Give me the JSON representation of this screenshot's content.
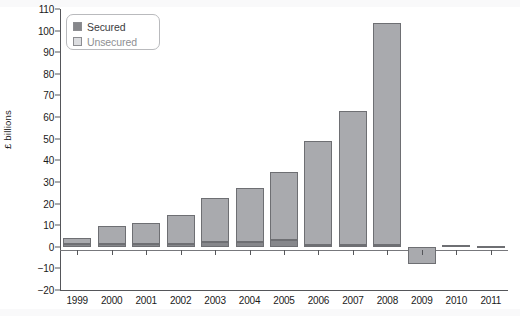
{
  "chart_data": {
    "type": "bar",
    "subtype": "stacked-bar",
    "title": "",
    "xlabel": "",
    "ylabel": "£ billions",
    "ylim": [
      -20,
      110
    ],
    "ytick_step": 10,
    "yticks": [
      110,
      100,
      90,
      80,
      70,
      60,
      50,
      40,
      30,
      20,
      10,
      0,
      -10,
      -20
    ],
    "ytick_labels": [
      "110",
      "100",
      "90",
      "80",
      "70",
      "60",
      "50",
      "40",
      "30",
      "20",
      "10",
      "0",
      "-10",
      "-20"
    ],
    "grid": false,
    "legend_position": "upper-left-inside",
    "categories": [
      "1999",
      "2000",
      "2001",
      "2002",
      "2003",
      "2004",
      "2005",
      "2006",
      "2007",
      "2008",
      "2009",
      "2010",
      "2011"
    ],
    "series": [
      {
        "name": "Secured",
        "color": "#86878b",
        "values": [
          1.5,
          1.5,
          1.5,
          1.5,
          2.0,
          2.0,
          3.0,
          1.0,
          1.0,
          1.0,
          0.0,
          0.0,
          0.0
        ]
      },
      {
        "name": "Unsecured",
        "color": "#a9aaae",
        "values": [
          2.5,
          8.0,
          9.5,
          13.0,
          20.5,
          25.0,
          31.5,
          48.0,
          62.0,
          102.5,
          -8.0,
          0.7,
          0.5
        ]
      }
    ],
    "totals": [
      4.0,
      9.5,
      11.0,
      14.5,
      22.5,
      27.0,
      34.5,
      49.0,
      63.0,
      103.5,
      -8.0,
      0.7,
      0.5
    ]
  },
  "legend": {
    "items": [
      {
        "label": "Secured",
        "color": "#86878b"
      },
      {
        "label": "Unsecured",
        "color": "#dcdde0"
      }
    ]
  },
  "axes": {
    "y_title": "£ billions"
  }
}
